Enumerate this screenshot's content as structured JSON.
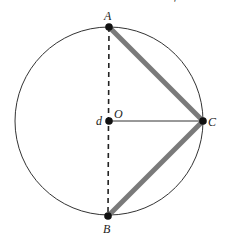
{
  "diagram": {
    "type": "circle-geometry",
    "circle": {
      "cx": 109,
      "cy": 121,
      "r": 94,
      "stroke": "#333333"
    },
    "points": {
      "A": {
        "label": "A",
        "x": 109,
        "y": 27
      },
      "B": {
        "label": "B",
        "x": 108,
        "y": 216
      },
      "C": {
        "label": "C",
        "x": 203,
        "y": 121
      },
      "O": {
        "label": "O",
        "x": 109,
        "y": 121
      }
    },
    "extra_labels": {
      "d": "d"
    },
    "segments": [
      {
        "from": "A",
        "to": "C",
        "style": "thick",
        "color": "#777777"
      },
      {
        "from": "C",
        "to": "B",
        "style": "thick",
        "color": "#777777"
      },
      {
        "from": "O",
        "to": "C",
        "style": "thin",
        "color": "#333333"
      },
      {
        "from": "A",
        "to": "B",
        "style": "dashed",
        "color": "#222222"
      }
    ],
    "top_fragment": "'"
  }
}
